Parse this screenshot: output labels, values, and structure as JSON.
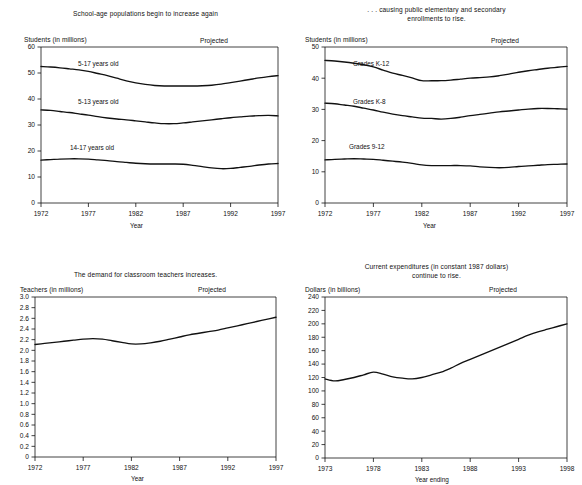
{
  "document": {
    "kind": "statistical-figure-sheet",
    "panel_count": 4
  },
  "panels": [
    {
      "id": "school-age-populations",
      "title": "School-age populations begin to increase again",
      "y_axis_unit": "Students (in millions)",
      "x_axis_name": "Year",
      "projected_note": "Projected",
      "series_labels": [
        "5-17 years old",
        "5-13 years old",
        "14-17 years old"
      ]
    },
    {
      "id": "public-enrollments",
      "title_line1": ". . . causing public elementary and secondary",
      "title_line2": "enrollments to rise.",
      "y_axis_unit": "Students (in millions)",
      "x_axis_name": "Year",
      "projected_note": "Projected",
      "series_labels": [
        "Grades K-12",
        "Grades K-8",
        "Grades 9-12"
      ]
    },
    {
      "id": "classroom-teachers",
      "title": "The demand for classroom teachers increases.",
      "y_axis_unit": "Teachers (in millions)",
      "x_axis_name": "Year",
      "projected_note": "Projected",
      "series_labels": []
    },
    {
      "id": "current-expenditures",
      "title_line1": "Current expenditures (in constant 1987 dollars)",
      "title_line2": "continue to rise.",
      "y_axis_unit": "Dollars (in billions)",
      "x_axis_name": "Year ending",
      "projected_note": "Projected",
      "series_labels": []
    }
  ],
  "chart_data": [
    {
      "type": "line",
      "title": "School-age populations begin to increase again",
      "xlabel": "Year",
      "ylabel": "Students (in millions)",
      "xlim": [
        1972,
        1997
      ],
      "ylim": [
        0,
        60
      ],
      "yticks": [
        0,
        10,
        20,
        30,
        40,
        50,
        60
      ],
      "xticks": [
        1972,
        1977,
        1982,
        1987,
        1992,
        1997
      ],
      "grid": false,
      "legend": "inline-labels",
      "annotations": [
        "Projected"
      ],
      "x": [
        1972,
        1973,
        1974,
        1975,
        1976,
        1977,
        1978,
        1979,
        1980,
        1981,
        1982,
        1983,
        1984,
        1985,
        1986,
        1987,
        1988,
        1989,
        1990,
        1991,
        1992,
        1993,
        1994,
        1995,
        1996,
        1997
      ],
      "series": [
        {
          "name": "5-17 years old",
          "values": [
            52.5,
            52.3,
            52.0,
            51.6,
            51.2,
            50.6,
            49.8,
            49.0,
            48.0,
            47.0,
            46.2,
            45.6,
            45.2,
            45.0,
            45.0,
            45.0,
            45.0,
            45.1,
            45.3,
            45.7,
            46.3,
            46.9,
            47.5,
            48.1,
            48.6,
            49.0
          ]
        },
        {
          "name": "5-13 years old",
          "values": [
            35.8,
            35.6,
            35.2,
            34.8,
            34.3,
            33.8,
            33.2,
            32.7,
            32.3,
            32.0,
            31.6,
            31.2,
            30.8,
            30.5,
            30.5,
            30.8,
            31.2,
            31.6,
            32.0,
            32.4,
            32.8,
            33.1,
            33.4,
            33.6,
            33.7,
            33.5
          ]
        },
        {
          "name": "14-17 years old",
          "values": [
            16.5,
            16.7,
            16.9,
            17.0,
            17.0,
            16.9,
            16.6,
            16.3,
            15.9,
            15.6,
            15.3,
            15.1,
            15.0,
            15.0,
            15.0,
            14.9,
            14.5,
            14.0,
            13.5,
            13.2,
            13.3,
            13.7,
            14.1,
            14.6,
            15.0,
            15.2
          ]
        }
      ]
    },
    {
      "type": "line",
      "title": ". . . causing public elementary and secondary enrollments to rise.",
      "xlabel": "Year",
      "ylabel": "Students (in millions)",
      "xlim": [
        1972,
        1997
      ],
      "ylim": [
        0,
        50
      ],
      "yticks": [
        0,
        10,
        20,
        30,
        40,
        50
      ],
      "xticks": [
        1972,
        1977,
        1982,
        1987,
        1992,
        1997
      ],
      "grid": false,
      "legend": "inline-labels",
      "annotations": [
        "Projected"
      ],
      "x": [
        1972,
        1973,
        1974,
        1975,
        1976,
        1977,
        1978,
        1979,
        1980,
        1981,
        1982,
        1983,
        1984,
        1985,
        1986,
        1987,
        1988,
        1989,
        1990,
        1991,
        1992,
        1993,
        1994,
        1995,
        1996,
        1997
      ],
      "series": [
        {
          "name": "Grades K-12",
          "values": [
            45.7,
            45.5,
            45.2,
            44.8,
            44.3,
            43.6,
            42.6,
            41.6,
            40.9,
            40.1,
            39.2,
            39.2,
            39.2,
            39.4,
            39.7,
            40.0,
            40.2,
            40.4,
            40.8,
            41.3,
            41.9,
            42.4,
            42.8,
            43.2,
            43.5,
            43.8
          ]
        },
        {
          "name": "Grades K-8",
          "values": [
            32.0,
            31.8,
            31.4,
            31.0,
            30.4,
            29.8,
            29.1,
            28.5,
            28.0,
            27.6,
            27.2,
            27.1,
            26.9,
            27.1,
            27.5,
            28.0,
            28.4,
            28.8,
            29.2,
            29.5,
            29.8,
            30.1,
            30.3,
            30.3,
            30.2,
            30.1
          ]
        },
        {
          "name": "Grades 9-12",
          "values": [
            13.8,
            14.0,
            14.1,
            14.2,
            14.1,
            14.0,
            13.7,
            13.4,
            13.1,
            12.7,
            12.2,
            12.0,
            12.0,
            12.0,
            12.0,
            11.9,
            11.6,
            11.4,
            11.3,
            11.4,
            11.7,
            11.9,
            12.1,
            12.3,
            12.4,
            12.5
          ]
        }
      ]
    },
    {
      "type": "line",
      "title": "The demand for classroom teachers increases.",
      "xlabel": "Year",
      "ylabel": "Teachers (in millions)",
      "xlim": [
        1972,
        1997
      ],
      "ylim": [
        0,
        3.0
      ],
      "yticks": [
        0,
        0.2,
        0.4,
        0.6,
        0.8,
        1.0,
        1.2,
        1.4,
        1.6,
        1.8,
        2.0,
        2.2,
        2.4,
        2.6,
        2.8,
        3.0
      ],
      "ytick_labels": [
        "0",
        "0.2",
        "0.4",
        "0.6",
        "0.8",
        "1.0",
        "1.2",
        "1.4",
        "1.6",
        "1.8",
        "2.0",
        "2.2",
        "2.4",
        "2.6",
        "2.8",
        "3.0"
      ],
      "xticks": [
        1972,
        1977,
        1982,
        1987,
        1992,
        1997
      ],
      "grid": false,
      "annotations": [
        "Projected"
      ],
      "x": [
        1972,
        1973,
        1974,
        1975,
        1976,
        1977,
        1978,
        1979,
        1980,
        1981,
        1982,
        1983,
        1984,
        1985,
        1986,
        1987,
        1988,
        1989,
        1990,
        1991,
        1992,
        1993,
        1994,
        1995,
        1996,
        1997
      ],
      "series": [
        {
          "name": "Classroom teachers",
          "values": [
            2.11,
            2.13,
            2.15,
            2.17,
            2.19,
            2.21,
            2.22,
            2.21,
            2.18,
            2.15,
            2.12,
            2.12,
            2.14,
            2.17,
            2.21,
            2.25,
            2.29,
            2.32,
            2.35,
            2.38,
            2.42,
            2.46,
            2.5,
            2.54,
            2.58,
            2.62
          ]
        }
      ]
    },
    {
      "type": "line",
      "title": "Current expenditures (in constant 1987 dollars) continue to rise.",
      "xlabel": "Year ending",
      "ylabel": "Dollars (in billions)",
      "xlim": [
        1973,
        1998
      ],
      "ylim": [
        0,
        240
      ],
      "yticks": [
        0,
        20,
        40,
        60,
        80,
        100,
        120,
        140,
        160,
        180,
        200,
        220,
        240
      ],
      "xticks": [
        1973,
        1978,
        1983,
        1988,
        1993,
        1998
      ],
      "grid": false,
      "annotations": [
        "Projected"
      ],
      "x": [
        1973,
        1974,
        1975,
        1976,
        1977,
        1978,
        1979,
        1980,
        1981,
        1982,
        1983,
        1984,
        1985,
        1986,
        1987,
        1988,
        1989,
        1990,
        1991,
        1992,
        1993,
        1994,
        1995,
        1996,
        1997,
        1998
      ],
      "series": [
        {
          "name": "Current expenditures",
          "values": [
            118,
            115,
            117,
            120,
            124,
            128,
            125,
            121,
            119,
            118,
            120,
            124,
            128,
            134,
            141,
            147,
            153,
            159,
            165,
            171,
            177,
            183,
            188,
            192,
            196,
            200
          ]
        }
      ]
    }
  ]
}
